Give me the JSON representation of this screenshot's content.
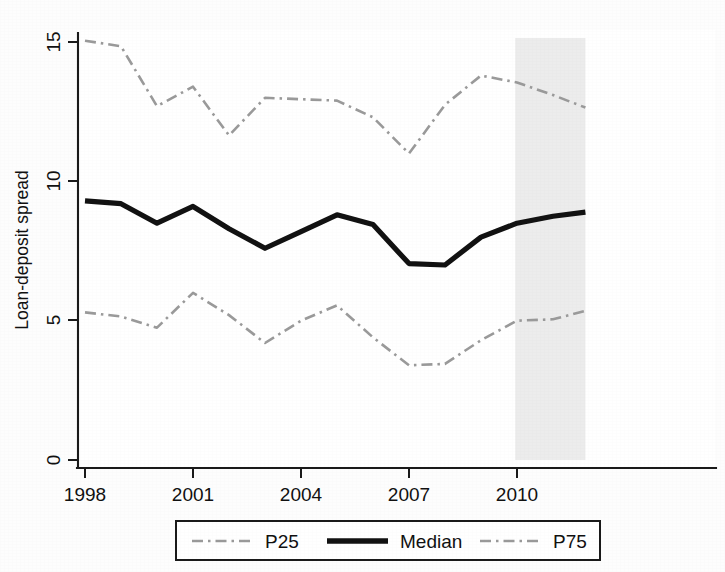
{
  "chart_data": {
    "type": "line",
    "title": "",
    "xlabel": "",
    "ylabel": "Loan-deposit spread",
    "xlim": [
      1997.8,
      2011.9
    ],
    "ylim": [
      0,
      15.6
    ],
    "grid": false,
    "legend_position": "bottom",
    "x_ticks": [
      "1998",
      "2001",
      "2004",
      "2007",
      "2010"
    ],
    "x_tick_values": [
      1998,
      2001,
      2004,
      2007,
      2010
    ],
    "y_ticks": [
      "0",
      "5",
      "10",
      "15"
    ],
    "y_tick_values": [
      0,
      5,
      10,
      15
    ],
    "shaded_region": {
      "label": "",
      "x_start": 2009.95,
      "x_end": 2011.9,
      "color": "#e9e9e9"
    },
    "x": [
      1998,
      1999,
      2000,
      2001,
      2002,
      2003,
      2004,
      2005,
      2006,
      2007,
      2008,
      2009,
      2010,
      2011,
      2011.9
    ],
    "series": [
      {
        "name": "P25",
        "style": "dash-dot",
        "color": "#9a9a9a",
        "values": [
          5.3,
          5.15,
          4.75,
          6.0,
          5.2,
          4.2,
          5.0,
          5.55,
          4.4,
          3.4,
          3.45,
          4.3,
          5.0,
          5.05,
          5.35
        ]
      },
      {
        "name": "Median",
        "style": "solid",
        "color": "#121212",
        "values": [
          9.3,
          9.2,
          8.5,
          9.1,
          8.3,
          7.6,
          8.2,
          8.8,
          8.45,
          7.05,
          7.0,
          8.0,
          8.5,
          8.75,
          8.9
        ]
      },
      {
        "name": "P75",
        "style": "dash-dot",
        "color": "#9a9a9a",
        "values": [
          15.05,
          14.85,
          12.7,
          13.4,
          11.65,
          13.0,
          12.95,
          12.9,
          12.3,
          11.0,
          12.75,
          13.8,
          13.55,
          13.1,
          12.65
        ]
      }
    ]
  },
  "axes": {
    "y_title": "Loan-deposit spread",
    "y_labels": [
      "15",
      "10",
      "5",
      "0"
    ],
    "x_labels": [
      "1998",
      "2001",
      "2004",
      "2007",
      "2010"
    ]
  },
  "legend": {
    "entries": [
      {
        "label": "P25",
        "swatch": "dash-dot-line-swatch"
      },
      {
        "label": "Median",
        "swatch": "solid-line-swatch"
      },
      {
        "label": "P75",
        "swatch": "dash-dot-line-swatch"
      }
    ]
  }
}
